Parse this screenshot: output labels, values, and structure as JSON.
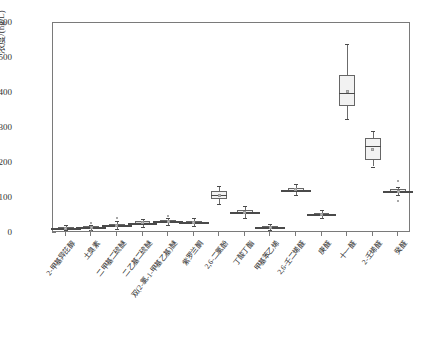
{
  "chart_data": {
    "type": "box",
    "title": "",
    "xlabel": "",
    "ylabel": "浓度/(ng/L)",
    "ylim": [
      0,
      600
    ],
    "yticks": [
      0,
      100,
      200,
      300,
      400,
      500,
      600
    ],
    "grid": false,
    "legend": "none",
    "units": "ng/L",
    "categories": [
      "2-甲基异芘醇",
      "土臭素",
      "二甲基二硫醚",
      "二乙基二硫醚",
      "双(2-氯-1-甲基乙基)醚",
      "紫罗兰酮",
      "2,6-二氯酚",
      "丁酸丁酯",
      "甲基苯乙烯",
      "2,6-壬二烯醛",
      "庚醛",
      "十一醛",
      "2-壬烯醛",
      "癸醛"
    ],
    "boxes": [
      {
        "category": "2-甲基异芘醇",
        "min": 8,
        "q1": 12,
        "median": 14,
        "mean": 14,
        "q3": 17,
        "max": 22,
        "outliers": []
      },
      {
        "category": "土臭素",
        "min": 10,
        "q1": 15,
        "median": 17,
        "mean": 17,
        "q3": 19,
        "max": 24,
        "outliers": [
          30,
          6
        ]
      },
      {
        "category": "二甲基二硫醚",
        "min": 12,
        "q1": 18,
        "median": 22,
        "mean": 22,
        "q3": 27,
        "max": 33,
        "outliers": [
          42
        ]
      },
      {
        "category": "二乙基二硫醚",
        "min": 18,
        "q1": 25,
        "median": 29,
        "mean": 29,
        "q3": 33,
        "max": 40,
        "outliers": []
      },
      {
        "category": "双(2-氯-1-甲基乙基)醚",
        "min": 22,
        "q1": 29,
        "median": 33,
        "mean": 33,
        "q3": 37,
        "max": 44,
        "outliers": [
          50
        ]
      },
      {
        "category": "紫罗兰酮",
        "min": 20,
        "q1": 27,
        "median": 31,
        "mean": 31,
        "q3": 35,
        "max": 42,
        "outliers": []
      },
      {
        "category": "2,6-二氯酚",
        "min": 82,
        "q1": 96,
        "median": 108,
        "mean": 107,
        "q3": 119,
        "max": 133,
        "outliers": []
      },
      {
        "category": "丁酸丁酯",
        "min": 44,
        "q1": 54,
        "median": 60,
        "mean": 60,
        "q3": 66,
        "max": 76,
        "outliers": []
      },
      {
        "category": "甲基苯乙烯",
        "min": 8,
        "q1": 13,
        "median": 16,
        "mean": 16,
        "q3": 19,
        "max": 25,
        "outliers": []
      },
      {
        "category": "2,6-壬二烯醛",
        "min": 108,
        "q1": 118,
        "median": 124,
        "mean": 124,
        "q3": 130,
        "max": 140,
        "outliers": []
      },
      {
        "category": "庚醛",
        "min": 42,
        "q1": 50,
        "median": 54,
        "mean": 54,
        "q3": 58,
        "max": 65,
        "outliers": []
      },
      {
        "category": "十一醛",
        "min": 325,
        "q1": 362,
        "median": 400,
        "mean": 404,
        "q3": 452,
        "max": 540,
        "outliers": []
      },
      {
        "category": "2-壬烯醛",
        "min": 190,
        "q1": 208,
        "median": 248,
        "mean": 240,
        "q3": 272,
        "max": 292,
        "outliers": []
      },
      {
        "category": "癸醛",
        "min": 108,
        "q1": 114,
        "median": 119,
        "mean": 119,
        "q3": 126,
        "max": 132,
        "outliers": [
          150,
          92
        ]
      }
    ],
    "colors": {
      "box_fill": "#f2f2f2",
      "box_edge": "#666666",
      "median": "#4a4a4a",
      "whisker": "#6b6b6b",
      "mean_marker": "#bdbdbd",
      "outlier": "#8a8a8a",
      "axis": "#7a7a7a",
      "text": "#2b2b2b"
    }
  }
}
